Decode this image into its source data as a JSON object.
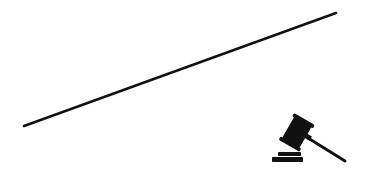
{
  "scene": {
    "background": "#ffffff",
    "ink_color": "#111111",
    "line": {
      "x1": 24,
      "y1": 126,
      "x2": 336,
      "y2": 13,
      "stroke_width": 2.5
    },
    "icon": {
      "name": "gavel-icon"
    }
  }
}
